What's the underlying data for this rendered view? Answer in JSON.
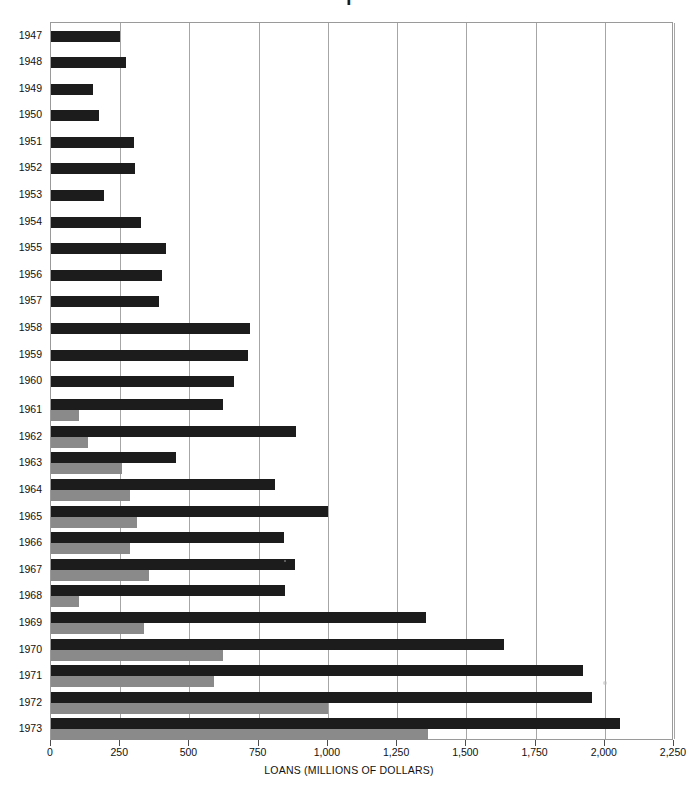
{
  "figure": {
    "title_fragment": "I",
    "background_color": "#ffffff"
  },
  "chart_data": {
    "type": "bar",
    "orientation": "horizontal",
    "title": "",
    "xlabel": "LOANS (MILLIONS OF DOLLARS)",
    "ylabel": "",
    "xlim": [
      0,
      2250
    ],
    "ylim": null,
    "grid": true,
    "legend_position": "none",
    "xticks": [
      0,
      250,
      500,
      750,
      1000,
      1250,
      1500,
      1750,
      2000,
      2250
    ],
    "xticklabels": [
      "0",
      "250",
      "500",
      "750",
      "1,000",
      "1,250",
      "1,500",
      "1,750",
      "2,000",
      "2,250"
    ],
    "categories": [
      "1947",
      "1948",
      "1949",
      "1950",
      "1951",
      "1952",
      "1953",
      "1954",
      "1955",
      "1956",
      "1957",
      "1958",
      "1959",
      "1960",
      "1961",
      "1962",
      "1963",
      "1964",
      "1965",
      "1966",
      "1967",
      "1968",
      "1969",
      "1970",
      "1971",
      "1972",
      "1973"
    ],
    "series": [
      {
        "name": "Total loans",
        "color": "#1c1c1c",
        "values": [
          250,
          272,
          150,
          175,
          300,
          305,
          190,
          325,
          415,
          400,
          390,
          720,
          710,
          660,
          620,
          885,
          450,
          810,
          1000,
          840,
          880,
          845,
          1355,
          1635,
          1920,
          1955,
          2055
        ]
      },
      {
        "name": "Second component",
        "color": "#8a8a8a",
        "values": [
          null,
          null,
          null,
          null,
          null,
          null,
          null,
          null,
          null,
          null,
          null,
          null,
          null,
          null,
          100,
          135,
          255,
          285,
          310,
          285,
          355,
          100,
          335,
          620,
          590,
          1000,
          1360
        ]
      }
    ]
  }
}
